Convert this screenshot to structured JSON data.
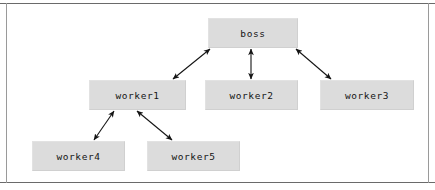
{
  "figure": {
    "width": 435,
    "height": 190,
    "background_color": "#ffffff",
    "frame_color": "#6e6e6e"
  },
  "style": {
    "node_fill": "#dcdcdc",
    "node_border": "#d0d0d0",
    "node_text_color": "#141414",
    "arrow_color": "#141414"
  },
  "diagram": {
    "type": "tree",
    "title": "",
    "nodes": [
      {
        "id": "boss",
        "label": "boss",
        "x": 208,
        "y": 18,
        "w": 90,
        "h": 30
      },
      {
        "id": "worker1",
        "label": "worker1",
        "x": 89,
        "y": 80,
        "w": 97,
        "h": 30
      },
      {
        "id": "worker2",
        "label": "worker2",
        "x": 205,
        "y": 80,
        "w": 93,
        "h": 30
      },
      {
        "id": "worker3",
        "label": "worker3",
        "x": 320,
        "y": 80,
        "w": 94,
        "h": 30
      },
      {
        "id": "worker4",
        "label": "worker4",
        "x": 32,
        "y": 141,
        "w": 93,
        "h": 30
      },
      {
        "id": "worker5",
        "label": "worker5",
        "x": 147,
        "y": 141,
        "w": 93,
        "h": 30
      }
    ],
    "edges": [
      {
        "from": "boss",
        "to": "worker1",
        "arrowheads": "both",
        "x1": 210,
        "y1": 49,
        "x2": 173,
        "y2": 79
      },
      {
        "from": "boss",
        "to": "worker2",
        "arrowheads": "both",
        "x1": 251,
        "y1": 49,
        "x2": 251,
        "y2": 79
      },
      {
        "from": "boss",
        "to": "worker3",
        "arrowheads": "both",
        "x1": 296,
        "y1": 49,
        "x2": 331,
        "y2": 79
      },
      {
        "from": "worker1",
        "to": "worker4",
        "arrowheads": "both",
        "x1": 114,
        "y1": 111,
        "x2": 94,
        "y2": 140
      },
      {
        "from": "worker1",
        "to": "worker5",
        "arrowheads": "both",
        "x1": 137,
        "y1": 111,
        "x2": 172,
        "y2": 140
      }
    ]
  }
}
